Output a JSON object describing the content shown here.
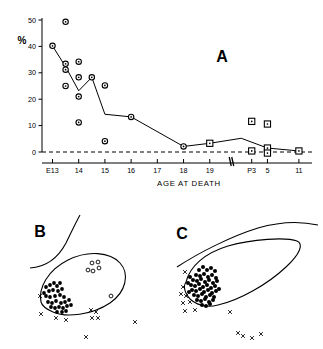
{
  "figure": {
    "panels": [
      "A",
      "B",
      "C"
    ],
    "panel_a_letter": "A",
    "panel_b_letter": "B",
    "panel_c_letter": "C"
  },
  "chart_data": [
    {
      "type": "scatter",
      "panel": "A",
      "title": "A",
      "xlabel": "AGE AT DEATH",
      "ylabel": "%",
      "ylim": [
        0,
        50
      ],
      "yticks": [
        0,
        10,
        20,
        30,
        40,
        50
      ],
      "ytick_labels": [
        "0",
        "10",
        "20",
        "30",
        "40",
        "50"
      ],
      "xtick_labels": [
        "E13",
        "14",
        "15",
        "16",
        "17",
        "18",
        "19",
        "P3",
        "5",
        "11"
      ],
      "xtick_positions": [
        13,
        14,
        15,
        16,
        17,
        18,
        19,
        20.6,
        21.2,
        22.4
      ],
      "axis_break_at": 19.8,
      "grid": false,
      "legend": "none",
      "zero_reference_line": 0,
      "series": [
        {
          "name": "individual cases (embryonic, open circles)",
          "marker": "open-circle",
          "points": [
            {
              "x": 13.0,
              "y": 40.2
            },
            {
              "x": 13.5,
              "y": 49.3
            },
            {
              "x": 13.5,
              "y": 33.4
            },
            {
              "x": 13.5,
              "y": 31.2
            },
            {
              "x": 13.5,
              "y": 25.0
            },
            {
              "x": 14.0,
              "y": 34.2
            },
            {
              "x": 14.0,
              "y": 28.3
            },
            {
              "x": 14.0,
              "y": 21.0
            },
            {
              "x": 14.0,
              "y": 11.2
            },
            {
              "x": 14.5,
              "y": 28.3
            },
            {
              "x": 15.0,
              "y": 25.2
            },
            {
              "x": 15.0,
              "y": 4.1
            },
            {
              "x": 16.0,
              "y": 13.3
            },
            {
              "x": 18.0,
              "y": 2.1
            }
          ]
        },
        {
          "name": "individual cases (postnatal, open squares)",
          "marker": "open-square",
          "points": [
            {
              "x": 19.0,
              "y": 3.3
            },
            {
              "x": 20.6,
              "y": 11.6
            },
            {
              "x": 21.2,
              "y": 10.6
            },
            {
              "x": 20.6,
              "y": 0.4
            },
            {
              "x": 21.2,
              "y": 1.5
            },
            {
              "x": 21.2,
              "y": -0.4
            },
            {
              "x": 22.4,
              "y": 0.4
            }
          ]
        },
        {
          "name": "mean trend line",
          "marker": "line",
          "points": [
            {
              "x": 13.0,
              "y": 40.2
            },
            {
              "x": 13.5,
              "y": 32.3
            },
            {
              "x": 14.0,
              "y": 23.2
            },
            {
              "x": 14.5,
              "y": 28.3
            },
            {
              "x": 15.0,
              "y": 14.3
            },
            {
              "x": 16.0,
              "y": 13.3
            },
            {
              "x": 18.0,
              "y": 2.1
            },
            {
              "x": 19.0,
              "y": 3.3
            },
            {
              "x": 20.2,
              "y": 5.2
            },
            {
              "x": 21.2,
              "y": 1.5
            },
            {
              "x": 22.4,
              "y": 0.4
            }
          ]
        }
      ]
    },
    {
      "type": "scatter",
      "panel": "B",
      "title": "B",
      "xlabel": "",
      "ylabel": "",
      "grid": false,
      "description": "anatomical section outline with labelled cell positions",
      "marker_legend": {
        "filled-dot": "labelled neurons (dense cluster)",
        "open-circle": "unlabelled / lightly labelled cells",
        "x-mark": "reference points outside outline"
      },
      "series": [
        {
          "name": "filled-dots",
          "marker": "filled-dot",
          "points": [
            {
              "x": 46,
              "y": 287
            },
            {
              "x": 50,
              "y": 285
            },
            {
              "x": 54,
              "y": 283
            },
            {
              "x": 57,
              "y": 286
            },
            {
              "x": 60,
              "y": 283
            },
            {
              "x": 49,
              "y": 291
            },
            {
              "x": 53,
              "y": 290
            },
            {
              "x": 58,
              "y": 291
            },
            {
              "x": 62,
              "y": 289
            },
            {
              "x": 46,
              "y": 296
            },
            {
              "x": 50,
              "y": 297
            },
            {
              "x": 55,
              "y": 296
            },
            {
              "x": 60,
              "y": 295
            },
            {
              "x": 64,
              "y": 297
            },
            {
              "x": 48,
              "y": 302
            },
            {
              "x": 52,
              "y": 303
            },
            {
              "x": 56,
              "y": 301
            },
            {
              "x": 61,
              "y": 303
            },
            {
              "x": 65,
              "y": 302
            },
            {
              "x": 69,
              "y": 300
            },
            {
              "x": 51,
              "y": 307
            },
            {
              "x": 55,
              "y": 308
            },
            {
              "x": 59,
              "y": 307
            },
            {
              "x": 63,
              "y": 308
            },
            {
              "x": 67,
              "y": 306
            },
            {
              "x": 71,
              "y": 305
            },
            {
              "x": 57,
              "y": 312
            },
            {
              "x": 62,
              "y": 312
            },
            {
              "x": 66,
              "y": 311
            },
            {
              "x": 44,
              "y": 293
            }
          ]
        },
        {
          "name": "open-circles",
          "marker": "open-circle",
          "points": [
            {
              "x": 92,
              "y": 263
            },
            {
              "x": 98,
              "y": 262
            },
            {
              "x": 88,
              "y": 270
            },
            {
              "x": 93,
              "y": 271
            },
            {
              "x": 99,
              "y": 268
            },
            {
              "x": 111,
              "y": 296
            }
          ]
        },
        {
          "name": "x-marks",
          "marker": "x-mark",
          "points": [
            {
              "x": 40,
              "y": 296
            },
            {
              "x": 41,
              "y": 314
            },
            {
              "x": 56,
              "y": 318
            },
            {
              "x": 66,
              "y": 320
            },
            {
              "x": 91,
              "y": 310
            },
            {
              "x": 96,
              "y": 312
            },
            {
              "x": 92,
              "y": 318
            },
            {
              "x": 98,
              "y": 318
            },
            {
              "x": 135,
              "y": 322
            },
            {
              "x": 86,
              "y": 337
            }
          ]
        }
      ]
    },
    {
      "type": "scatter",
      "panel": "C",
      "title": "C",
      "xlabel": "",
      "ylabel": "",
      "grid": false,
      "description": "anatomical section outline with dense labelled cell cluster at rostral pole",
      "marker_legend": {
        "filled-dot": "labelled neurons (very dense cluster)",
        "x-mark": "reference points outside outline"
      },
      "series": [
        {
          "name": "filled-dots",
          "marker": "filled-dot",
          "points": [
            {
              "x": 199,
              "y": 270
            },
            {
              "x": 203,
              "y": 267
            },
            {
              "x": 207,
              "y": 270
            },
            {
              "x": 211,
              "y": 268
            },
            {
              "x": 215,
              "y": 271
            },
            {
              "x": 196,
              "y": 275
            },
            {
              "x": 200,
              "y": 276
            },
            {
              "x": 204,
              "y": 274
            },
            {
              "x": 208,
              "y": 277
            },
            {
              "x": 212,
              "y": 275
            },
            {
              "x": 216,
              "y": 278
            },
            {
              "x": 193,
              "y": 280
            },
            {
              "x": 197,
              "y": 281
            },
            {
              "x": 201,
              "y": 279
            },
            {
              "x": 205,
              "y": 282
            },
            {
              "x": 209,
              "y": 280
            },
            {
              "x": 213,
              "y": 283
            },
            {
              "x": 217,
              "y": 281
            },
            {
              "x": 191,
              "y": 285
            },
            {
              "x": 195,
              "y": 286
            },
            {
              "x": 199,
              "y": 284
            },
            {
              "x": 203,
              "y": 287
            },
            {
              "x": 207,
              "y": 285
            },
            {
              "x": 211,
              "y": 288
            },
            {
              "x": 215,
              "y": 286
            },
            {
              "x": 219,
              "y": 289
            },
            {
              "x": 192,
              "y": 290
            },
            {
              "x": 196,
              "y": 291
            },
            {
              "x": 200,
              "y": 289
            },
            {
              "x": 204,
              "y": 292
            },
            {
              "x": 208,
              "y": 290
            },
            {
              "x": 212,
              "y": 293
            },
            {
              "x": 216,
              "y": 291
            },
            {
              "x": 194,
              "y": 295
            },
            {
              "x": 198,
              "y": 296
            },
            {
              "x": 202,
              "y": 294
            },
            {
              "x": 206,
              "y": 297
            },
            {
              "x": 210,
              "y": 295
            },
            {
              "x": 214,
              "y": 297
            },
            {
              "x": 197,
              "y": 300
            },
            {
              "x": 201,
              "y": 301
            },
            {
              "x": 205,
              "y": 299
            },
            {
              "x": 209,
              "y": 302
            },
            {
              "x": 213,
              "y": 300
            },
            {
              "x": 202,
              "y": 305
            },
            {
              "x": 206,
              "y": 306
            },
            {
              "x": 210,
              "y": 304
            },
            {
              "x": 190,
              "y": 277
            },
            {
              "x": 188,
              "y": 283
            },
            {
              "x": 189,
              "y": 292
            }
          ]
        },
        {
          "name": "x-marks",
          "marker": "x-mark",
          "points": [
            {
              "x": 185,
              "y": 272
            },
            {
              "x": 183,
              "y": 287
            },
            {
              "x": 181,
              "y": 294
            },
            {
              "x": 186,
              "y": 296
            },
            {
              "x": 183,
              "y": 303
            },
            {
              "x": 190,
              "y": 302
            },
            {
              "x": 185,
              "y": 311
            },
            {
              "x": 195,
              "y": 310
            },
            {
              "x": 230,
              "y": 312
            },
            {
              "x": 238,
              "y": 333
            },
            {
              "x": 243,
              "y": 336
            },
            {
              "x": 252,
              "y": 338
            },
            {
              "x": 261,
              "y": 334
            }
          ]
        }
      ]
    }
  ],
  "colors": {
    "ink": "#000000",
    "background": "#ffffff"
  }
}
